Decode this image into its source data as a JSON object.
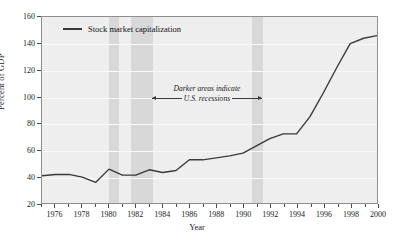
{
  "chart_data": {
    "type": "line",
    "title": "",
    "xlabel": "Year",
    "ylabel": "Percent of GDP",
    "xlim": [
      1975,
      2000
    ],
    "ylim": [
      20,
      160
    ],
    "xticks": [
      1976,
      1978,
      1980,
      1982,
      1984,
      1986,
      1988,
      1990,
      1992,
      1994,
      1996,
      1998,
      2000
    ],
    "xtick_labels": [
      "1976",
      "1978",
      "1980",
      "1982",
      "1984",
      "1986",
      "1988",
      "1990",
      "1992",
      "1994",
      "1996",
      "1998",
      "2000"
    ],
    "xticks_minor": [
      1975,
      1977,
      1979,
      1981,
      1983,
      1985,
      1987,
      1989,
      1991,
      1993,
      1995,
      1997,
      1999
    ],
    "yticks": [
      20,
      40,
      60,
      80,
      100,
      120,
      140,
      160
    ],
    "ytick_labels": [
      "20",
      "40",
      "60",
      "80",
      "100",
      "120",
      "140",
      "160"
    ],
    "grid": true,
    "legend_position": "top-left",
    "series": [
      {
        "name": "Stock market capitalization",
        "color": "#3a3a3a",
        "x": [
          1975,
          1976,
          1977,
          1978,
          1979,
          1980,
          1981,
          1982,
          1983,
          1984,
          1985,
          1986,
          1987,
          1988,
          1989,
          1990,
          1991,
          1992,
          1993,
          1994,
          1995,
          1996,
          1997,
          1998,
          1999,
          2000
        ],
        "values": [
          40.5,
          41.5,
          41.5,
          39.5,
          35.5,
          45.5,
          41.0,
          41.0,
          45.0,
          43.0,
          44.5,
          52.5,
          52.5,
          54.0,
          55.5,
          57.5,
          63.0,
          68.5,
          72.0,
          72.0,
          85.0,
          103.0,
          122.0,
          140.0,
          144.0,
          146.0
        ]
      }
    ],
    "shaded_regions": [
      {
        "label": "U.S. recession",
        "x0": 1980.0,
        "x1": 1980.7,
        "color": "#d8d8d8"
      },
      {
        "label": "U.S. recession",
        "x0": 1981.6,
        "x1": 1983.2,
        "color": "#d8d8d8"
      },
      {
        "label": "U.S. recession",
        "x0": 1990.6,
        "x1": 1991.4,
        "color": "#d8d8d8"
      }
    ],
    "annotations": [
      {
        "text_line1": "Darker areas indicate",
        "text_line2": "U.S. recessions",
        "style": "italic-with-double-arrow"
      }
    ]
  },
  "legend": {
    "entries": [
      {
        "label": "Stock market capitalization",
        "color": "#3a3a3a"
      }
    ]
  },
  "axes": {
    "ylabel": "Percent of GDP",
    "xlabel": "Year"
  },
  "annotation": {
    "line1": "Darker areas indicate",
    "line2": "U.S. recessions"
  },
  "colors": {
    "plot_background": "#eeeeee",
    "recession_band": "#d8d8d8",
    "series_line": "#3a3a3a",
    "gridline": "#fafafa",
    "axis": "#8f8f8f",
    "text": "#1b1b1b"
  }
}
